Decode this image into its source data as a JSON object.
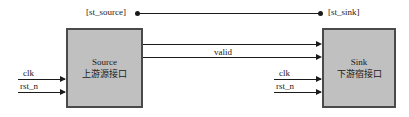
{
  "diagram": {
    "colors": {
      "block_fill": "#c0c0c0",
      "block_border": "#4a4a4a",
      "line": "#1a1a1a",
      "background": "#ffffff"
    },
    "top_connection": {
      "left_label": "[st_source]",
      "right_label": "[st_sink]",
      "left_endpoint": "dot",
      "right_endpoint": "dot"
    },
    "blocks": [
      {
        "id": "source",
        "name_en": "Source",
        "name_cn": "上游源接口"
      },
      {
        "id": "sink",
        "name_en": "Sink",
        "name_cn": "下游宿接口"
      }
    ],
    "signals": {
      "bus_label": "valid",
      "source_clock_inputs": [
        "clk",
        "rst_n"
      ],
      "sink_clock_inputs": [
        "clk",
        "rst_n"
      ]
    }
  }
}
